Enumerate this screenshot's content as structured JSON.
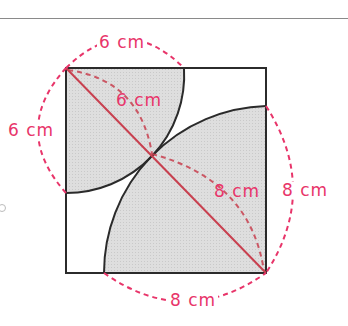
{
  "diagram": {
    "colors": {
      "outline": "#2b2b2b",
      "shade": "#dcdcdc",
      "annotation": "#e8356a",
      "diagonal": "#c8404f"
    },
    "labels": {
      "top": "6 cm",
      "left": "6 cm",
      "inner_small": "6 cm",
      "inner_large": "8 cm",
      "right": "8 cm",
      "bottom": "8 cm"
    },
    "shapes": {
      "square_side_cm": 14,
      "small_quarter_circle_radius_cm": 6,
      "large_quarter_circle_radius_cm": 8
    }
  }
}
